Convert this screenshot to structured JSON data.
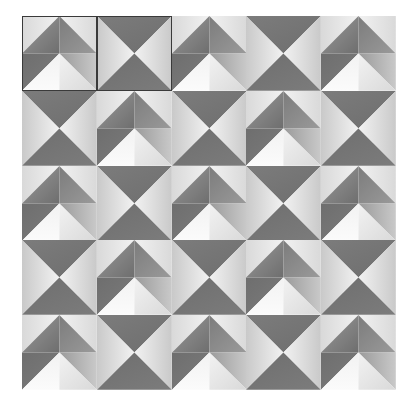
{
  "canvas": {
    "width": 415,
    "height": 404,
    "background": "#ffffff"
  },
  "grid": {
    "left": 22,
    "top": 16,
    "width": 374,
    "height": 374,
    "columns": 5,
    "rows": 5,
    "tile_size": 74.8,
    "label": "Tiled pyramid pattern"
  },
  "palette": {
    "dark_gray": "#6e6e6e",
    "mid_dark_gray": "#7c7c7c",
    "mid_gray": "#9a9a9a",
    "light_gray": "#c9c9c9",
    "pale_gray": "#d9d9d9",
    "near_white": "#f2f2f2",
    "white": "#fbfbfb",
    "selection_outline": "#3a3a3a",
    "background": "#ffffff"
  },
  "tile_types": {
    "A": {
      "name": "chevron-pyramid-tile",
      "description": "Upper inverted-V ridge with two dark faces meeting at a top-center apex, flanked by pale outer faces; lower half is a bright white chevron framed by mid gray faces."
    },
    "B": {
      "name": "x-diamond-tile",
      "description": "Four triangles meeting at tile center: dark top, dark bottom, light left, light right, forming an X."
    }
  },
  "tiles": [
    [
      {
        "type": "A",
        "selected": true,
        "row": 0,
        "col": 0
      },
      {
        "type": "B",
        "selected": true,
        "row": 0,
        "col": 1
      },
      {
        "type": "A",
        "selected": false,
        "row": 0,
        "col": 2
      },
      {
        "type": "B",
        "selected": false,
        "row": 0,
        "col": 3
      },
      {
        "type": "A",
        "selected": false,
        "row": 0,
        "col": 4
      }
    ],
    [
      {
        "type": "B",
        "selected": false,
        "row": 1,
        "col": 0
      },
      {
        "type": "A",
        "selected": false,
        "row": 1,
        "col": 1
      },
      {
        "type": "B",
        "selected": false,
        "row": 1,
        "col": 2
      },
      {
        "type": "A",
        "selected": false,
        "row": 1,
        "col": 3
      },
      {
        "type": "B",
        "selected": false,
        "row": 1,
        "col": 4
      }
    ],
    [
      {
        "type": "A",
        "selected": false,
        "row": 2,
        "col": 0
      },
      {
        "type": "B",
        "selected": false,
        "row": 2,
        "col": 1
      },
      {
        "type": "A",
        "selected": false,
        "row": 2,
        "col": 2
      },
      {
        "type": "B",
        "selected": false,
        "row": 2,
        "col": 3
      },
      {
        "type": "A",
        "selected": false,
        "row": 2,
        "col": 4
      }
    ],
    [
      {
        "type": "B",
        "selected": false,
        "row": 3,
        "col": 0
      },
      {
        "type": "A",
        "selected": false,
        "row": 3,
        "col": 1
      },
      {
        "type": "B",
        "selected": false,
        "row": 3,
        "col": 2
      },
      {
        "type": "A",
        "selected": false,
        "row": 3,
        "col": 3
      },
      {
        "type": "B",
        "selected": false,
        "row": 3,
        "col": 4
      }
    ],
    [
      {
        "type": "A",
        "selected": false,
        "row": 4,
        "col": 0
      },
      {
        "type": "B",
        "selected": false,
        "row": 4,
        "col": 1
      },
      {
        "type": "A",
        "selected": false,
        "row": 4,
        "col": 2
      },
      {
        "type": "B",
        "selected": false,
        "row": 4,
        "col": 3
      },
      {
        "type": "A",
        "selected": false,
        "row": 4,
        "col": 4
      }
    ]
  ],
  "selection": {
    "count": 2,
    "cells": [
      "0,0",
      "0,1"
    ],
    "outline_color": "#3a3a3a"
  }
}
